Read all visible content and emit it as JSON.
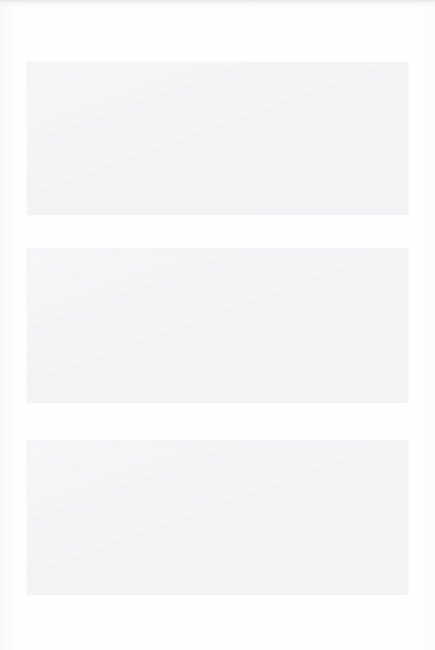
{
  "document": {
    "title": "",
    "background_color": "#fefefe",
    "width": 435,
    "height": 650,
    "content_note": ""
  },
  "scan_edge": {
    "name": "top-edge-band",
    "color": "#e7e8e9",
    "label": ""
  },
  "panels": [
    {
      "index": 1,
      "label": "",
      "text": "",
      "fill_color": "#f0f1f2",
      "border_color": "#f4f5f5",
      "x": 27,
      "y": 62,
      "width": 381,
      "height": 153
    },
    {
      "index": 2,
      "label": "",
      "text": "",
      "fill_color": "#f0f1f2",
      "border_color": "#f4f5f5",
      "x": 27,
      "y": 248,
      "width": 381,
      "height": 155
    },
    {
      "index": 3,
      "label": "",
      "text": "",
      "fill_color": "#f0f1f2",
      "border_color": "#f4f5f5",
      "x": 27,
      "y": 440,
      "width": 381,
      "height": 155
    }
  ],
  "margins": {
    "header_text": "",
    "footer_text": "",
    "gap_1_text": "",
    "gap_2_text": ""
  }
}
